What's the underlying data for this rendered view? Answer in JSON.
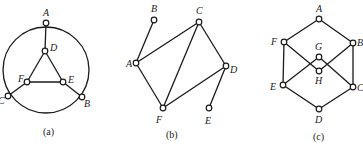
{
  "figures": [
    {
      "id": "a",
      "caption": "(a)",
      "caption_pos": [
        43,
        135
      ],
      "circle": {
        "cx": 46,
        "cy": 70,
        "r": 43
      },
      "nodes": [
        {
          "name": "A",
          "x": 46,
          "y": 23,
          "lx": 43,
          "ly": 16
        },
        {
          "name": "D",
          "x": 45,
          "y": 51,
          "lx": 50,
          "ly": 51
        },
        {
          "name": "F",
          "x": 27,
          "y": 82,
          "lx": 18,
          "ly": 82
        },
        {
          "name": "E",
          "x": 63,
          "y": 82,
          "lx": 68,
          "ly": 83
        },
        {
          "name": "C",
          "x": 8,
          "y": 96,
          "lx": -2,
          "ly": 104
        },
        {
          "name": "B",
          "x": 82,
          "y": 97,
          "lx": 84,
          "ly": 107
        }
      ],
      "edges": [
        [
          "A",
          "D"
        ],
        [
          "D",
          "F"
        ],
        [
          "D",
          "E"
        ],
        [
          "F",
          "E"
        ],
        [
          "F",
          "C"
        ],
        [
          "E",
          "B"
        ]
      ]
    },
    {
      "id": "b",
      "caption": "(b)",
      "caption_pos": [
        166,
        138
      ],
      "nodes": [
        {
          "name": "B",
          "x": 154,
          "y": 20,
          "lx": 151,
          "ly": 12
        },
        {
          "name": "C",
          "x": 199,
          "y": 22,
          "lx": 196,
          "ly": 14
        },
        {
          "name": "A",
          "x": 136,
          "y": 63,
          "lx": 126,
          "ly": 67
        },
        {
          "name": "D",
          "x": 226,
          "y": 66,
          "lx": 230,
          "ly": 73
        },
        {
          "name": "F",
          "x": 163,
          "y": 108,
          "lx": 156,
          "ly": 123
        },
        {
          "name": "E",
          "x": 209,
          "y": 108,
          "lx": 205,
          "ly": 124
        }
      ],
      "edges": [
        [
          "A",
          "B"
        ],
        [
          "A",
          "C"
        ],
        [
          "A",
          "F"
        ],
        [
          "C",
          "F"
        ],
        [
          "C",
          "D"
        ],
        [
          "F",
          "D"
        ],
        [
          "D",
          "E"
        ]
      ]
    },
    {
      "id": "c",
      "caption": "(c)",
      "caption_pos": [
        313,
        140
      ],
      "nodes": [
        {
          "name": "A",
          "x": 319,
          "y": 19,
          "lx": 316,
          "ly": 12
        },
        {
          "name": "F",
          "x": 284,
          "y": 42,
          "lx": 271,
          "ly": 45
        },
        {
          "name": "B",
          "x": 353,
          "y": 43,
          "lx": 357,
          "ly": 46
        },
        {
          "name": "G",
          "x": 319,
          "y": 57,
          "lx": 315,
          "ly": 50
        },
        {
          "name": "H",
          "x": 319,
          "y": 71,
          "lx": 315,
          "ly": 84
        },
        {
          "name": "E",
          "x": 283,
          "y": 85,
          "lx": 270,
          "ly": 90
        },
        {
          "name": "C",
          "x": 353,
          "y": 87,
          "lx": 357,
          "ly": 91
        },
        {
          "name": "D",
          "x": 319,
          "y": 109,
          "lx": 315,
          "ly": 123
        }
      ],
      "edges": [
        [
          "A",
          "F"
        ],
        [
          "A",
          "B"
        ],
        [
          "F",
          "E"
        ],
        [
          "B",
          "C"
        ],
        [
          "E",
          "D"
        ],
        [
          "C",
          "D"
        ],
        [
          "F",
          "H"
        ],
        [
          "E",
          "G"
        ],
        [
          "G",
          "C"
        ],
        [
          "H",
          "B"
        ]
      ]
    }
  ]
}
